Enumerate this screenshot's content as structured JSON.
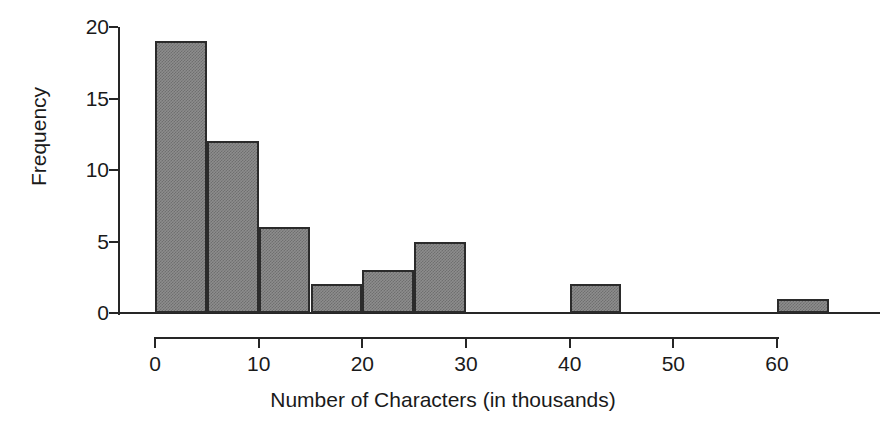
{
  "chart_data": {
    "type": "bar",
    "title": "",
    "subtitle": "",
    "xlabel": "Number of Characters (in thousands)",
    "ylabel": "Frequency",
    "xlim": [
      0,
      65
    ],
    "ylim": [
      0,
      20
    ],
    "grid": false,
    "legend": null,
    "bin_width": 5,
    "categories": [
      "0-5",
      "5-10",
      "10-15",
      "15-20",
      "20-25",
      "25-30",
      "30-35",
      "35-40",
      "40-45",
      "45-50",
      "50-55",
      "55-60",
      "60-65"
    ],
    "bin_starts": [
      0,
      5,
      10,
      15,
      20,
      25,
      30,
      35,
      40,
      45,
      50,
      55,
      60
    ],
    "values": [
      19,
      12,
      6,
      2,
      3,
      5,
      0,
      0,
      2,
      0,
      0,
      0,
      1
    ],
    "xticks": [
      0,
      10,
      20,
      30,
      40,
      50,
      60
    ],
    "xtick_labels": [
      "0",
      "10",
      "20",
      "30",
      "40",
      "50",
      "60"
    ],
    "yticks": [
      0,
      5,
      10,
      15,
      20
    ],
    "ytick_labels": [
      "0",
      "5",
      "10",
      "15",
      "20"
    ],
    "bar_fill_color": "#8d8d8d",
    "bar_edge_color": "#2b2b2b",
    "axis_color": "#262626",
    "background_color": "#ffffff"
  }
}
